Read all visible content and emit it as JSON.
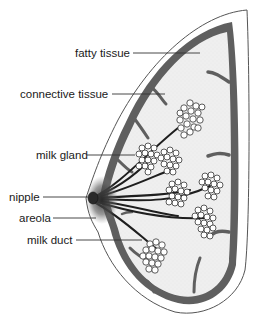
{
  "diagram": {
    "labels": [
      {
        "id": "fatty-tissue",
        "text": "fatty tissue"
      },
      {
        "id": "connective-tissue",
        "text": "connective tissue"
      },
      {
        "id": "milk-gland",
        "text": "milk gland"
      },
      {
        "id": "nipple",
        "text": "nipple"
      },
      {
        "id": "areola",
        "text": "areola"
      },
      {
        "id": "milk-duct",
        "text": "milk duct"
      }
    ],
    "colors": {
      "outline": "#555555",
      "connective": "#5f5f5f",
      "fat": "#eeeeee",
      "gland_stroke": "#333333",
      "duct": "#1e1e1e",
      "areola": "#3a3a3a"
    }
  }
}
